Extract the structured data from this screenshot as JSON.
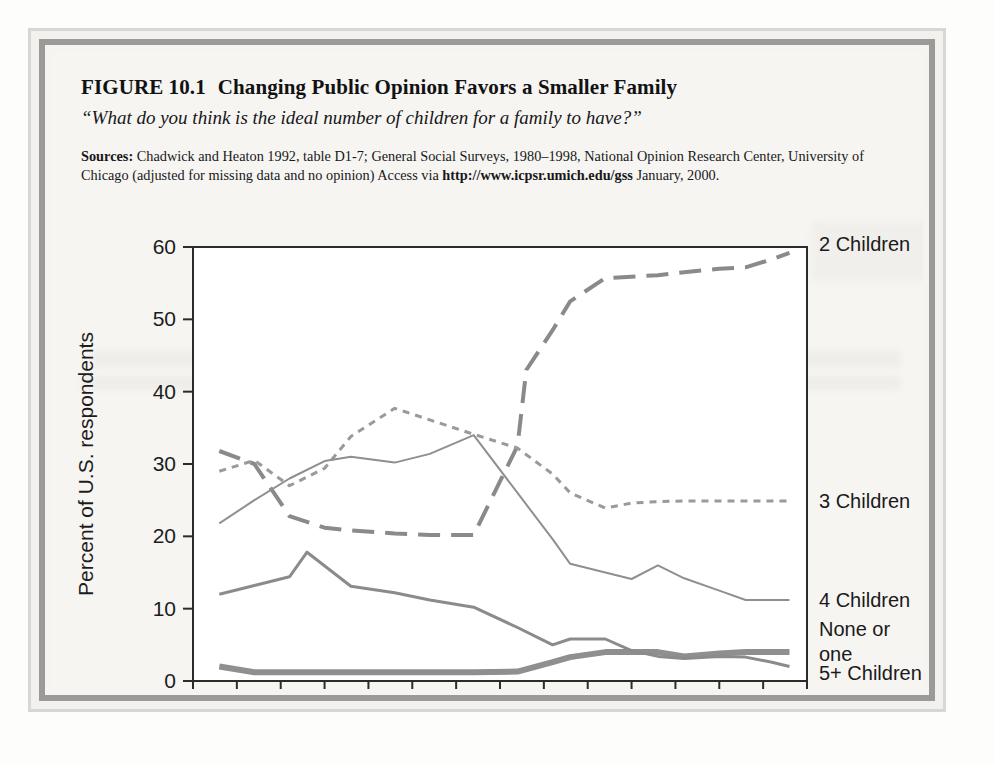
{
  "figure": {
    "number": "FIGURE 10.1",
    "title": "Changing Public Opinion Favors a Smaller Family",
    "subtitle": "“What do you think is the ideal number of children for a family to have?”",
    "sources_label": "Sources:",
    "sources_text_1": " Chadwick and Heaton 1992, table D1-7; General Social Surveys, 1980–1998, National Opinion Research Center, University of Chicago (adjusted for missing data and no opinion) Access via ",
    "sources_url": "http://www.icpsr.umich.edu/gss",
    "sources_text_2": " January, 2000."
  },
  "colors": {
    "frame_outer": "#d8d7d3",
    "frame_inner": "#9a9a99",
    "page_bg": "#f6f5f2",
    "plot_bg": "#ffffff",
    "axis": "#2b2b2b",
    "two_children": "#8a8a8a",
    "three_children": "#9a9a9a",
    "four_children": "#8f8f8f",
    "none_or_one": "#8f8f8f",
    "five_plus": "#8b8b8b"
  },
  "chart_data": {
    "type": "line",
    "title": "Changing Public Opinion Favors a Smaller Family",
    "subtitle": "“What do you think is the ideal number of children for a family to have?”",
    "xlabel": "",
    "ylabel": "Percent of U.S. respondents",
    "xlim": [
      1930,
      2000
    ],
    "ylim": [
      0,
      60
    ],
    "xticks": [
      1930,
      1940,
      1950,
      1960,
      1970,
      1980,
      1990,
      2000
    ],
    "xtick_labels": [
      "1930",
      "1940",
      "1950",
      "1960",
      "1970",
      "1980",
      "1990",
      "2000"
    ],
    "x_minor_ticks": [
      1935,
      1945,
      1955,
      1965,
      1975,
      1985,
      1995
    ],
    "yticks": [
      0,
      10,
      20,
      30,
      40,
      50,
      60
    ],
    "ytick_labels": [
      "0",
      "10",
      "20",
      "30",
      "40",
      "50",
      "60"
    ],
    "grid": false,
    "legend_position": "right-of-axes",
    "series": [
      {
        "name": "2 Children",
        "label": "2 Children",
        "style": "long-dash",
        "width": 4,
        "color": "#8a8a8a",
        "x": [
          1933,
          1937,
          1941,
          1945,
          1948,
          1953,
          1957,
          1962,
          1967,
          1968,
          1971,
          1973,
          1977,
          1980,
          1983,
          1986,
          1990,
          1993,
          1996,
          1998
        ],
        "y": [
          31.8,
          30.0,
          22.8,
          21.2,
          20.8,
          20.4,
          20.2,
          20.2,
          32.5,
          43.0,
          48.5,
          52.5,
          55.7,
          55.9,
          56.1,
          56.5,
          57.0,
          57.2,
          58.3,
          59.2
        ]
      },
      {
        "name": "3 Children",
        "label": "3 Children",
        "style": "short-dash",
        "width": 3,
        "color": "#9a9a9a",
        "x": [
          1933,
          1937,
          1941,
          1945,
          1948,
          1953,
          1957,
          1962,
          1967,
          1971,
          1973,
          1977,
          1980,
          1983,
          1986,
          1990,
          1993,
          1996,
          1998
        ],
        "y": [
          29.0,
          30.5,
          27.0,
          29.4,
          33.8,
          37.7,
          36.1,
          34.1,
          32.2,
          28.6,
          26.0,
          23.9,
          24.6,
          24.8,
          24.9,
          24.9,
          24.9,
          24.9,
          24.9
        ]
      },
      {
        "name": "4 Children",
        "label": "4 Children",
        "style": "solid-thin",
        "width": 2,
        "color": "#8f8f8f",
        "x": [
          1933,
          1937,
          1941,
          1945,
          1948,
          1953,
          1957,
          1962,
          1967,
          1971,
          1973,
          1977,
          1980,
          1983,
          1986,
          1990,
          1993,
          1996,
          1998
        ],
        "y": [
          21.8,
          25.0,
          28.0,
          30.4,
          31.0,
          30.2,
          31.4,
          34.0,
          26.0,
          19.6,
          16.2,
          15.0,
          14.1,
          16.0,
          14.2,
          12.5,
          11.2,
          11.2,
          11.2
        ]
      },
      {
        "name": "None or one",
        "label": "None or\none",
        "label_line1": "None or",
        "label_line2": "one",
        "style": "solid-thick",
        "width": 6,
        "color": "#8f8f8f",
        "x": [
          1933,
          1937,
          1941,
          1945,
          1948,
          1953,
          1957,
          1962,
          1967,
          1971,
          1973,
          1977,
          1980,
          1983,
          1986,
          1990,
          1993,
          1996,
          1998
        ],
        "y": [
          2.0,
          1.2,
          1.2,
          1.2,
          1.2,
          1.2,
          1.2,
          1.2,
          1.3,
          2.6,
          3.3,
          4.0,
          4.0,
          4.0,
          3.4,
          3.8,
          4.0,
          4.0,
          4.0
        ]
      },
      {
        "name": "5+ Children",
        "label": "5+ Children",
        "style": "solid-medium",
        "width": 3,
        "color": "#8b8b8b",
        "x": [
          1933,
          1937,
          1941,
          1943,
          1948,
          1953,
          1957,
          1962,
          1967,
          1971,
          1973,
          1977,
          1980,
          1983,
          1986,
          1990,
          1993,
          1996,
          1998
        ],
        "y": [
          12.0,
          13.2,
          14.4,
          17.8,
          13.1,
          12.2,
          11.2,
          10.2,
          7.4,
          5.0,
          5.8,
          5.8,
          4.2,
          3.4,
          3.1,
          3.4,
          3.3,
          2.6,
          2.0
        ]
      }
    ]
  },
  "axis": {
    "y_title": "Percent of U.S. respondents"
  }
}
